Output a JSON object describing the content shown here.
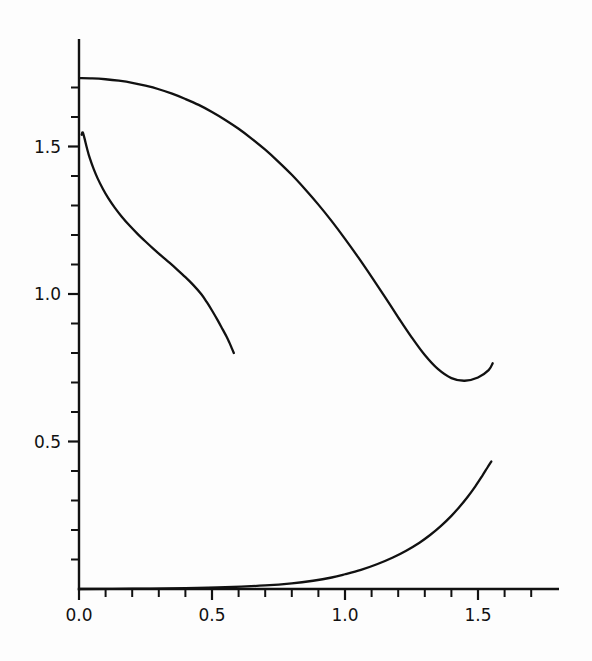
{
  "chart_data": {
    "type": "line",
    "title": "",
    "subtitle": "",
    "xlabel": "",
    "ylabel": "",
    "xlim": [
      -0.04,
      1.8
    ],
    "ylim": [
      -0.02,
      1.86
    ],
    "grid": false,
    "legend": null,
    "background": "#fdfdfd",
    "line_color": "#111111",
    "axis_color": "#111111",
    "x_ticks_major": [
      0.0,
      0.5,
      1.0,
      1.5
    ],
    "x_tick_labels": [
      "0.0",
      "0.5",
      "1.0",
      "1.5"
    ],
    "x_ticks_minor": [
      0.1,
      0.2,
      0.3,
      0.4,
      0.6,
      0.7,
      0.8,
      0.9,
      1.1,
      1.2,
      1.3,
      1.4,
      1.6,
      1.7
    ],
    "y_ticks_major": [
      0.5,
      1.0,
      1.5
    ],
    "y_tick_labels": [
      "0.5",
      "1.0",
      "1.5"
    ],
    "y_ticks_minor": [
      0.1,
      0.2,
      0.3,
      0.4,
      0.6,
      0.7,
      0.8,
      0.9,
      1.1,
      1.2,
      1.3,
      1.4,
      1.6,
      1.7
    ],
    "series": [
      {
        "name": "upper-decreasing-curve",
        "points": [
          [
            0.0,
            1.732
          ],
          [
            0.05,
            1.731
          ],
          [
            0.1,
            1.728
          ],
          [
            0.15,
            1.723
          ],
          [
            0.2,
            1.716
          ],
          [
            0.25,
            1.706
          ],
          [
            0.3,
            1.694
          ],
          [
            0.35,
            1.679
          ],
          [
            0.4,
            1.661
          ],
          [
            0.45,
            1.641
          ],
          [
            0.5,
            1.617
          ],
          [
            0.55,
            1.59
          ],
          [
            0.6,
            1.56
          ],
          [
            0.65,
            1.526
          ],
          [
            0.7,
            1.489
          ],
          [
            0.75,
            1.448
          ],
          [
            0.8,
            1.404
          ],
          [
            0.85,
            1.355
          ],
          [
            0.9,
            1.303
          ],
          [
            0.95,
            1.247
          ],
          [
            1.0,
            1.187
          ],
          [
            1.05,
            1.124
          ],
          [
            1.1,
            1.058
          ],
          [
            1.15,
            0.99
          ],
          [
            1.2,
            0.921
          ],
          [
            1.25,
            0.854
          ],
          [
            1.3,
            0.793
          ],
          [
            1.35,
            0.745
          ],
          [
            1.4,
            0.715
          ],
          [
            1.45,
            0.706
          ],
          [
            1.5,
            0.717
          ],
          [
            1.54,
            0.742
          ],
          [
            1.555,
            0.765
          ]
        ]
      },
      {
        "name": "steep-decaying-curve",
        "points": [
          [
            0.01,
            1.54
          ],
          [
            0.014,
            1.548
          ],
          [
            0.02,
            1.53
          ],
          [
            0.03,
            1.494
          ],
          [
            0.04,
            1.462
          ],
          [
            0.055,
            1.424
          ],
          [
            0.07,
            1.392
          ],
          [
            0.09,
            1.356
          ],
          [
            0.11,
            1.325
          ],
          [
            0.135,
            1.292
          ],
          [
            0.16,
            1.263
          ],
          [
            0.19,
            1.232
          ],
          [
            0.22,
            1.204
          ],
          [
            0.25,
            1.178
          ],
          [
            0.28,
            1.153
          ],
          [
            0.31,
            1.129
          ],
          [
            0.34,
            1.106
          ],
          [
            0.37,
            1.082
          ],
          [
            0.4,
            1.057
          ],
          [
            0.43,
            1.03
          ],
          [
            0.46,
            0.999
          ],
          [
            0.48,
            0.973
          ],
          [
            0.5,
            0.944
          ],
          [
            0.52,
            0.913
          ],
          [
            0.54,
            0.88
          ],
          [
            0.555,
            0.855
          ],
          [
            0.565,
            0.836
          ],
          [
            0.575,
            0.815
          ],
          [
            0.582,
            0.8
          ]
        ]
      },
      {
        "name": "lower-increasing-curve",
        "points": [
          [
            0.0,
            0.0
          ],
          [
            0.2,
            0.001
          ],
          [
            0.4,
            0.003
          ],
          [
            0.55,
            0.006
          ],
          [
            0.7,
            0.012
          ],
          [
            0.8,
            0.019
          ],
          [
            0.88,
            0.028
          ],
          [
            0.95,
            0.039
          ],
          [
            1.0,
            0.05
          ],
          [
            1.06,
            0.065
          ],
          [
            1.12,
            0.084
          ],
          [
            1.18,
            0.107
          ],
          [
            1.23,
            0.13
          ],
          [
            1.28,
            0.157
          ],
          [
            1.32,
            0.183
          ],
          [
            1.36,
            0.213
          ],
          [
            1.4,
            0.248
          ],
          [
            1.43,
            0.278
          ],
          [
            1.46,
            0.311
          ],
          [
            1.49,
            0.348
          ],
          [
            1.515,
            0.382
          ],
          [
            1.535,
            0.411
          ],
          [
            1.55,
            0.432
          ]
        ]
      }
    ]
  },
  "figure": {
    "caption": "",
    "alt": "Plot of three unlabeled curves on linear axes"
  }
}
